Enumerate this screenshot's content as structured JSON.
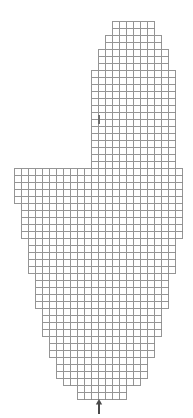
{
  "figure": {
    "width_px": 193,
    "height_px": 418,
    "background_color": "#ffffff"
  },
  "grid": {
    "cell_size_px": 7,
    "origin_x_px": 14,
    "origin_y_px": 21,
    "columns_total": 24,
    "rows_total": 54,
    "line_color": "#8a8a8a",
    "cell_fill_color": "#ffffff",
    "line_width_px": 0.9
  },
  "chart_data": {
    "type": "heatmap",
    "xlabel": "",
    "ylabel": "",
    "grid": true,
    "legend": "none",
    "columns": 24,
    "rows": 54,
    "row_spans": [
      [
        14,
        19
      ],
      [
        14,
        19
      ],
      [
        13,
        20
      ],
      [
        13,
        20
      ],
      [
        12,
        21
      ],
      [
        12,
        21
      ],
      [
        12,
        21
      ],
      [
        11,
        22
      ],
      [
        11,
        22
      ],
      [
        11,
        22
      ],
      [
        11,
        22
      ],
      [
        11,
        22
      ],
      [
        11,
        22
      ],
      [
        11,
        22
      ],
      [
        11,
        22
      ],
      [
        11,
        22
      ],
      [
        11,
        22
      ],
      [
        11,
        22
      ],
      [
        11,
        22
      ],
      [
        11,
        22
      ],
      [
        11,
        22
      ],
      [
        0,
        23
      ],
      [
        0,
        23
      ],
      [
        0,
        23
      ],
      [
        0,
        23
      ],
      [
        0,
        23
      ],
      [
        1,
        23
      ],
      [
        1,
        23
      ],
      [
        1,
        23
      ],
      [
        1,
        23
      ],
      [
        1,
        23
      ],
      [
        2,
        22
      ],
      [
        2,
        22
      ],
      [
        2,
        22
      ],
      [
        2,
        22
      ],
      [
        2,
        22
      ],
      [
        3,
        21
      ],
      [
        3,
        21
      ],
      [
        3,
        21
      ],
      [
        3,
        21
      ],
      [
        3,
        21
      ],
      [
        4,
        20
      ],
      [
        4,
        20
      ],
      [
        4,
        20
      ],
      [
        4,
        20
      ],
      [
        5,
        19
      ],
      [
        5,
        19
      ],
      [
        5,
        19
      ],
      [
        6,
        18
      ],
      [
        6,
        18
      ],
      [
        6,
        18
      ],
      [
        7,
        17
      ],
      [
        9,
        15
      ],
      [
        9,
        15
      ]
    ],
    "markers": [
      {
        "name": "interior-tick",
        "type": "vertical-tick",
        "x_px": 99,
        "y_top_px": 115,
        "y_bottom_px": 124,
        "color": "#6e6e6e"
      },
      {
        "name": "bottom-pointer",
        "type": "up-arrow",
        "x_px": 99,
        "y_tip_px": 399,
        "y_tail_px": 414,
        "color": "#4a4a4a"
      }
    ]
  }
}
